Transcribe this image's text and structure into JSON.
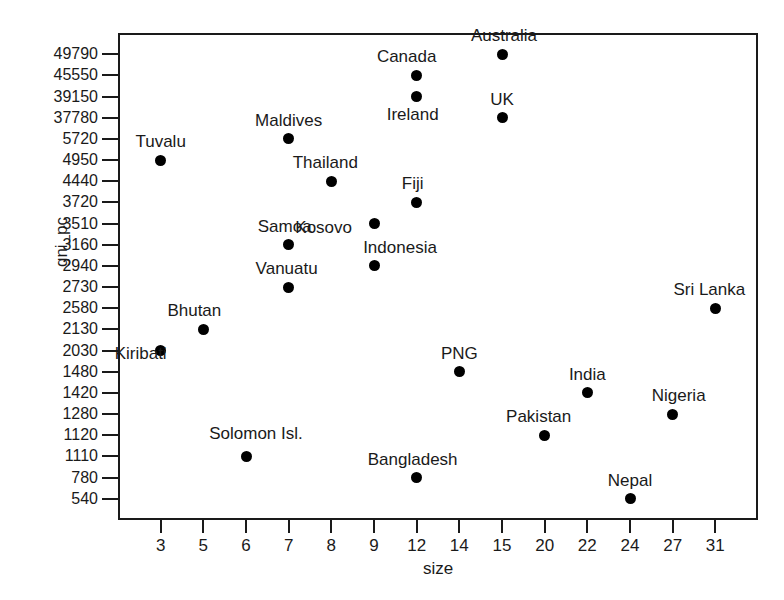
{
  "chart_data": {
    "type": "scatter",
    "title": "",
    "xlabel": "size",
    "ylabel": "gni_pc",
    "grid": false,
    "legend": null,
    "x_tick_labels": [
      "3",
      "5",
      "6",
      "7",
      "8",
      "9",
      "12",
      "14",
      "15",
      "20",
      "22",
      "24",
      "27",
      "31"
    ],
    "y_tick_labels": [
      "49790",
      "45550",
      "39150",
      "37780",
      "5720",
      "4950",
      "4440",
      "3720",
      "3510",
      "3160",
      "2940",
      "2730",
      "2580",
      "2130",
      "2030",
      "1480",
      "1420",
      "1280",
      "1120",
      "1110",
      "780",
      "540"
    ],
    "x_axis_type": "categorical-ordinal",
    "y_axis_type": "categorical-ordinal",
    "marker_color": "#000000",
    "axis_color": "#1a1a1a",
    "points": [
      {
        "label": "Australia",
        "x": 15,
        "y": 49790,
        "label_pos": "above"
      },
      {
        "label": "Canada",
        "x": 12,
        "y": 45550,
        "label_pos": "above"
      },
      {
        "label": "Ireland",
        "x": 12,
        "y": 39150,
        "label_pos": "below"
      },
      {
        "label": "UK",
        "x": 15,
        "y": 37780,
        "label_pos": "above"
      },
      {
        "label": "Maldives",
        "x": 7,
        "y": 5720,
        "label_pos": "above"
      },
      {
        "label": "Tuvalu",
        "x": 3,
        "y": 4950,
        "label_pos": "above"
      },
      {
        "label": "Thailand",
        "x": 8,
        "y": 4440,
        "label_pos": "above"
      },
      {
        "label": "Fiji",
        "x": 12,
        "y": 3720,
        "label_pos": "above"
      },
      {
        "label": "Kosovo",
        "x": 9,
        "y": 3510,
        "label_pos": "above"
      },
      {
        "label": "Samoa",
        "x": 7,
        "y": 3160,
        "label_pos": "above"
      },
      {
        "label": "Indonesia",
        "x": 9,
        "y": 2940,
        "label_pos": "above"
      },
      {
        "label": "Vanuatu",
        "x": 7,
        "y": 2730,
        "label_pos": "above"
      },
      {
        "label": "Sri Lanka",
        "x": 31,
        "y": 2580,
        "label_pos": "above"
      },
      {
        "label": "Bhutan",
        "x": 5,
        "y": 2130,
        "label_pos": "above"
      },
      {
        "label": "Kiribati",
        "x": 3,
        "y": 2030,
        "label_pos": "above"
      },
      {
        "label": "PNG",
        "x": 14,
        "y": 1480,
        "label_pos": "above"
      },
      {
        "label": "India",
        "x": 22,
        "y": 1420,
        "label_pos": "above"
      },
      {
        "label": "Nigeria",
        "x": 27,
        "y": 1280,
        "label_pos": "above"
      },
      {
        "label": "Pakistan",
        "x": 20,
        "y": 1120,
        "label_pos": "above"
      },
      {
        "label": "Solomon Isl.",
        "x": 6,
        "y": 1110,
        "label_pos": "above"
      },
      {
        "label": "Bangladesh",
        "x": 12,
        "y": 780,
        "label_pos": "above"
      },
      {
        "label": "Nepal",
        "x": 24,
        "y": 540,
        "label_pos": "above"
      }
    ]
  }
}
